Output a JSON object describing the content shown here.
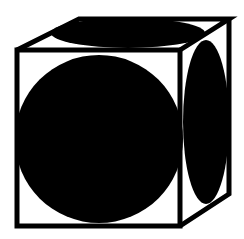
{
  "diagram": {
    "colors": {
      "stroke": "#000000",
      "fill": "#000000",
      "background": "#ffffff"
    },
    "faces": [
      {
        "name": "front",
        "shape": "circle"
      },
      {
        "name": "top",
        "shape": "ellipse"
      },
      {
        "name": "right",
        "shape": "ellipse"
      }
    ]
  }
}
